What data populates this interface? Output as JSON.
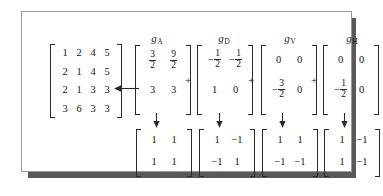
{
  "figure": {
    "panel_background": "#ffffff",
    "panel_border_color": "#9a9a9a",
    "shadow_color": "#595959",
    "ink_color": "#141414"
  },
  "columns": [
    {
      "label_base": "g",
      "label_sub": "A",
      "name": "g-a"
    },
    {
      "label_base": "g",
      "label_sub": "D",
      "name": "g-d"
    },
    {
      "label_base": "g",
      "label_sub": "V",
      "name": "g-v"
    },
    {
      "label_base": "g",
      "label_sub": "H",
      "name": "g-h"
    }
  ],
  "source_matrix": {
    "rows": 4,
    "cols": 4,
    "cells": [
      "1",
      "2",
      "4",
      "5",
      "2",
      "1",
      "4",
      "5",
      "2",
      "1",
      "3",
      "3",
      "3",
      "6",
      "3",
      "3"
    ]
  },
  "operators": {
    "plus": "+",
    "arrow_left": "left-arrow",
    "arrow_down": "down-arrow"
  },
  "coefficient_matrices": [
    {
      "name": "g-a",
      "cells": [
        {
          "kind": "fraction",
          "sign": "",
          "num": "3",
          "den": "2"
        },
        {
          "kind": "fraction",
          "sign": "",
          "num": "9",
          "den": "2"
        },
        {
          "kind": "plain",
          "text": "3"
        },
        {
          "kind": "plain",
          "text": "3"
        }
      ]
    },
    {
      "name": "g-d",
      "cells": [
        {
          "kind": "fraction",
          "sign": "−",
          "num": "1",
          "den": "2"
        },
        {
          "kind": "fraction",
          "sign": "−",
          "num": "1",
          "den": "2"
        },
        {
          "kind": "plain",
          "text": "1"
        },
        {
          "kind": "plain",
          "text": "0"
        }
      ]
    },
    {
      "name": "g-v",
      "cells": [
        {
          "kind": "plain",
          "text": "0"
        },
        {
          "kind": "plain",
          "text": "0"
        },
        {
          "kind": "fraction",
          "sign": "−",
          "num": "3",
          "den": "2"
        },
        {
          "kind": "plain",
          "text": "0"
        }
      ]
    },
    {
      "name": "g-h",
      "cells": [
        {
          "kind": "plain",
          "text": "0"
        },
        {
          "kind": "plain",
          "text": "0"
        },
        {
          "kind": "fraction",
          "sign": "−",
          "num": "1",
          "den": "2"
        },
        {
          "kind": "plain",
          "text": "0"
        }
      ]
    }
  ],
  "sign_matrices": [
    {
      "name": "basis-a",
      "cells": [
        "1",
        "1",
        "1",
        "1"
      ]
    },
    {
      "name": "basis-d",
      "cells": [
        "1",
        "−1",
        "−1",
        "1"
      ]
    },
    {
      "name": "basis-v",
      "cells": [
        "1",
        "1",
        "−1",
        "−1"
      ]
    },
    {
      "name": "basis-h",
      "cells": [
        "1",
        "−1",
        "1",
        "−1"
      ]
    }
  ]
}
